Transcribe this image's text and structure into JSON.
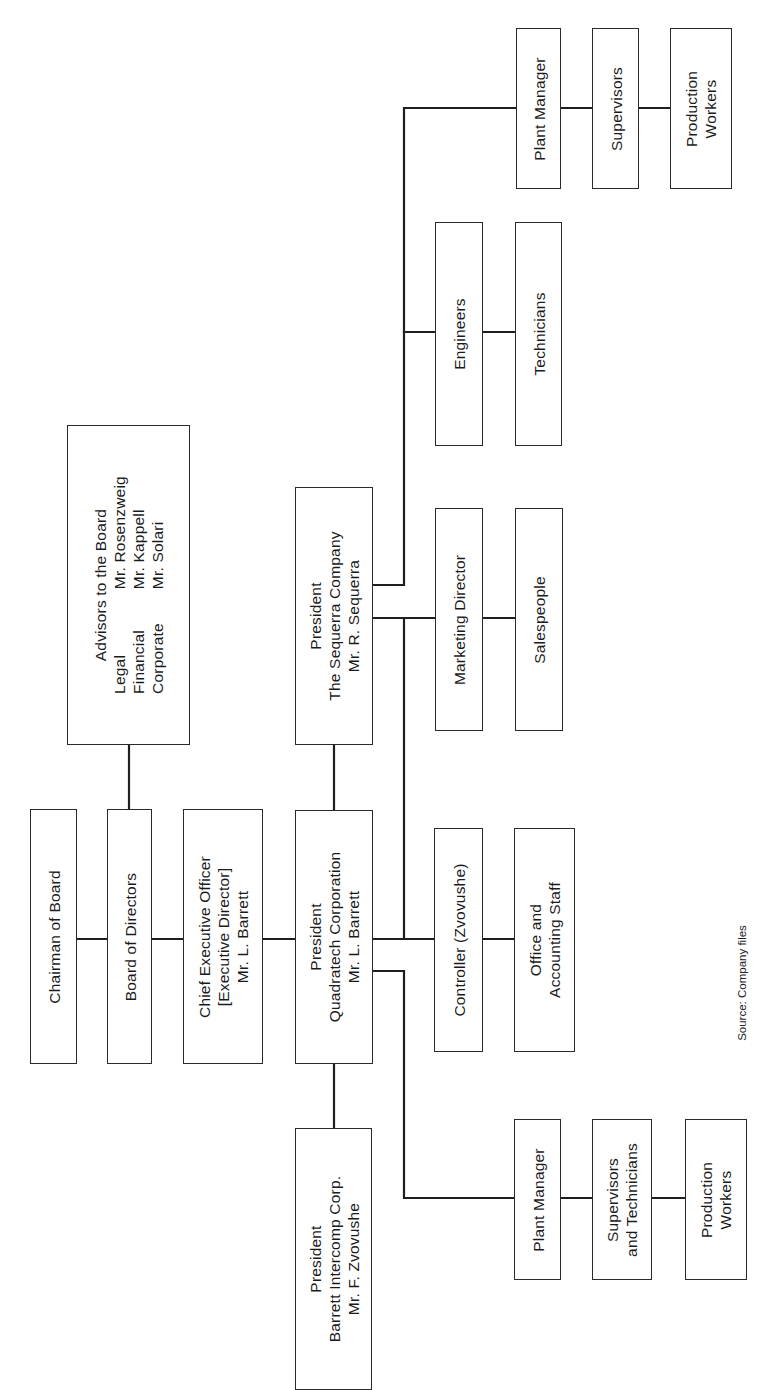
{
  "chart": {
    "type": "organization-chart",
    "orientation": "rotated-90-ccw",
    "line_color": "#1f1f1f",
    "box_border_color": "#2a2a2a",
    "background": "#ffffff"
  },
  "nodes": {
    "chairman": {
      "lines": [
        "Chairman of Board"
      ]
    },
    "board": {
      "lines": [
        "Board of Directors"
      ]
    },
    "advisors": {
      "title": "Advisors to the Board",
      "rows": [
        {
          "area": "Legal",
          "name": "Mr. Rosenzweig"
        },
        {
          "area": "Financial",
          "name": "Mr. Kappell"
        },
        {
          "area": "Corporate",
          "name": "Mr. Solari"
        }
      ]
    },
    "ceo": {
      "lines": [
        "Chief Executive Officer",
        "[Executive Director]",
        "Mr. L. Barrett"
      ]
    },
    "president_quadratech": {
      "lines": [
        "President",
        "Quadratech Corporation",
        "Mr. L. Barrett"
      ]
    },
    "president_sequerra": {
      "lines": [
        "President",
        "The Sequerra Company",
        "Mr. R. Sequerra"
      ]
    },
    "president_barrett": {
      "lines": [
        "President",
        "Barrett Intercomp Corp.",
        "Mr. F. Zvovushe"
      ]
    },
    "controller": {
      "lines": [
        "Controller (Zvovushe)"
      ]
    },
    "office_staff": {
      "lines": [
        "Office and",
        "Accounting Staff"
      ]
    },
    "marketing_director": {
      "lines": [
        "Marketing Director"
      ]
    },
    "salespeople": {
      "lines": [
        "Salespeople"
      ]
    },
    "engineers": {
      "lines": [
        "Engineers"
      ]
    },
    "technicians": {
      "lines": [
        "Technicians"
      ]
    },
    "sequerra_plant_manager": {
      "lines": [
        "Plant Manager"
      ]
    },
    "sequerra_supervisors": {
      "lines": [
        "Supervisors"
      ]
    },
    "sequerra_production_workers": {
      "lines": [
        "Production",
        "Workers"
      ]
    },
    "quadratech_plant_manager": {
      "lines": [
        "Plant Manager"
      ]
    },
    "quadratech_supervisors": {
      "lines": [
        "Supervisors",
        "and Technicians"
      ]
    },
    "quadratech_production_workers": {
      "lines": [
        "Production",
        "Workers"
      ]
    }
  },
  "edges": [
    [
      "chairman",
      "board"
    ],
    [
      "board",
      "advisors"
    ],
    [
      "board",
      "ceo"
    ],
    [
      "ceo",
      "president_quadratech"
    ],
    [
      "president_quadratech",
      "president_sequerra"
    ],
    [
      "president_quadratech",
      "president_barrett"
    ],
    [
      "president_quadratech",
      "controller"
    ],
    [
      "controller",
      "office_staff"
    ],
    [
      "president_quadratech",
      "quadratech_plant_manager"
    ],
    [
      "quadratech_plant_manager",
      "quadratech_supervisors"
    ],
    [
      "quadratech_supervisors",
      "quadratech_production_workers"
    ],
    [
      "president_sequerra",
      "marketing_director"
    ],
    [
      "marketing_director",
      "salespeople"
    ],
    [
      "president_sequerra",
      "engineers"
    ],
    [
      "engineers",
      "technicians"
    ],
    [
      "president_sequerra",
      "sequerra_plant_manager"
    ],
    [
      "sequerra_plant_manager",
      "sequerra_supervisors"
    ],
    [
      "sequerra_supervisors",
      "sequerra_production_workers"
    ]
  ],
  "source": "Source: Company files"
}
